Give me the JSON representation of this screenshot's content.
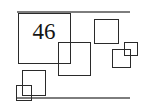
{
  "figure": {
    "kind": "geometry-diagram",
    "background_color": "#ffffff",
    "stroke_color": "#2a2a2a",
    "rule_color": "#7d7d7d",
    "label_color": "#141414",
    "canvas": {
      "width": 146,
      "height": 111
    },
    "label": {
      "text": "46",
      "name": "square-area-label",
      "x": 27,
      "y": 20,
      "width": 34,
      "font_size": 23
    },
    "rules": [
      {
        "name": "top-rule",
        "x": 17,
        "y": 11,
        "width": 113,
        "height": 2
      },
      {
        "name": "bottom-rule",
        "x": 17,
        "y": 97,
        "width": 113,
        "height": 2
      }
    ],
    "squares": [
      {
        "name": "large-square-46",
        "x": 18,
        "y": 13,
        "size_w": 53,
        "size_h": 51,
        "order": 1
      },
      {
        "name": "middle-overlap-square",
        "x": 58,
        "y": 42,
        "size_w": 33,
        "size_h": 34,
        "order": 2
      },
      {
        "name": "top-right-square",
        "x": 94,
        "y": 19,
        "size_w": 25,
        "size_h": 25,
        "order": 3
      },
      {
        "name": "right-tiny-square",
        "x": 124,
        "y": 42,
        "size_w": 14,
        "size_h": 14,
        "order": 4
      },
      {
        "name": "right-small-square",
        "x": 112,
        "y": 49,
        "size_w": 19,
        "size_h": 19,
        "order": 5
      },
      {
        "name": "bottom-left-square",
        "x": 22,
        "y": 70,
        "size_w": 24,
        "size_h": 26,
        "order": 6
      },
      {
        "name": "bottom-left-tiny-square",
        "x": 16,
        "y": 85,
        "size_w": 16,
        "size_h": 16,
        "order": 7
      }
    ]
  }
}
